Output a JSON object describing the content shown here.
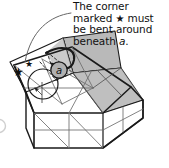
{
  "figure": {
    "kind": "origami-fold-instruction-diagram",
    "width": 169,
    "height": 168,
    "background_color": "#ffffff"
  },
  "caption": {
    "full_text": "The corner marked ★ must be bent around beneath a.",
    "lines": [
      "The corner",
      "marked ★ must",
      "be bent around",
      "beneath a."
    ],
    "segment_before_star": "The corner\nmarked ",
    "star_glyph": "★",
    "segment_after_star": " must\nbe bent around\nbeneath ",
    "italic_reference": "a",
    "trailing_punctuation": ".",
    "text_color": "#111111"
  },
  "labels": {
    "circled_label": "a",
    "star_marker": "★",
    "star_marker_count": 2
  },
  "colors": {
    "paper_white": "#ffffff",
    "shaded_flap": "#b9b9b9",
    "shaded_flap_dark": "#a8a8a8",
    "shaded_flap_light": "#cccccc",
    "outline": "#1a1a1a",
    "crease_line": "#6e6e6e",
    "dashed_crease": "#3a3a3a",
    "leader_line": "#555555",
    "faint_circle": "#cfcfcf"
  },
  "diagram": {
    "elements": [
      {
        "name": "box-base-grid",
        "label": "crease grid on box base"
      },
      {
        "name": "box-front-face",
        "label": "front face of box"
      },
      {
        "name": "box-right-face",
        "label": "right side face of box"
      },
      {
        "name": "shaded-flap",
        "label": "shaded folded flap"
      },
      {
        "name": "rear-panel",
        "label": "raised rear panel"
      },
      {
        "name": "dashed-fold-lines",
        "label": "dashed valley fold lines"
      },
      {
        "name": "curved-fold-arrow",
        "label": "curved arrow showing fold direction"
      },
      {
        "name": "circled-a-label",
        "label": "circled letter a"
      },
      {
        "name": "star-marker-outer",
        "label": "star marker on outer corner"
      },
      {
        "name": "star-marker-inner",
        "label": "star marker on inner corner"
      },
      {
        "name": "leader-line",
        "label": "curved leader line from caption to diagram"
      },
      {
        "name": "partial-circle-edge",
        "label": "faint partial circle at left edge"
      }
    ]
  }
}
